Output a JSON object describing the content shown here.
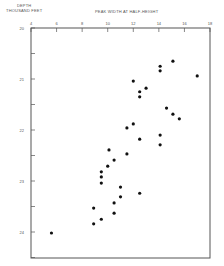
{
  "chart_data": {
    "type": "scatter",
    "title": "",
    "xlabel": "PEAK WIDTH AT HALF-HEIGHT",
    "ylabel": "DEPTH THOUSAND FEET",
    "ylabel_lines": [
      "DEPTH",
      "THOUSAND FEET"
    ],
    "xlim": [
      4,
      18
    ],
    "ylim": [
      20,
      24.5
    ],
    "y_inverted": true,
    "x_ticks": [
      4,
      6,
      8,
      10,
      12,
      14,
      16,
      18
    ],
    "y_ticks": [
      20,
      21,
      22,
      23,
      24
    ],
    "grid": false,
    "legend": null,
    "x_axis_position": "top",
    "points": [
      {
        "x": 12.0,
        "y": 21.04
      },
      {
        "x": 12.5,
        "y": 21.25
      },
      {
        "x": 13.0,
        "y": 21.18
      },
      {
        "x": 12.5,
        "y": 21.35
      },
      {
        "x": 14.1,
        "y": 20.75
      },
      {
        "x": 14.1,
        "y": 20.84
      },
      {
        "x": 15.1,
        "y": 20.65
      },
      {
        "x": 17.0,
        "y": 20.94
      },
      {
        "x": 14.6,
        "y": 21.57
      },
      {
        "x": 15.1,
        "y": 21.69
      },
      {
        "x": 15.6,
        "y": 21.78
      },
      {
        "x": 11.5,
        "y": 21.96
      },
      {
        "x": 12.0,
        "y": 21.88
      },
      {
        "x": 14.1,
        "y": 22.1
      },
      {
        "x": 12.5,
        "y": 22.18
      },
      {
        "x": 14.1,
        "y": 22.29
      },
      {
        "x": 10.1,
        "y": 22.39
      },
      {
        "x": 11.5,
        "y": 22.47
      },
      {
        "x": 10.5,
        "y": 22.59
      },
      {
        "x": 10.0,
        "y": 22.71
      },
      {
        "x": 9.5,
        "y": 22.82
      },
      {
        "x": 9.5,
        "y": 22.92
      },
      {
        "x": 9.5,
        "y": 23.04
      },
      {
        "x": 11.0,
        "y": 23.12
      },
      {
        "x": 11.0,
        "y": 23.31
      },
      {
        "x": 12.5,
        "y": 23.24
      },
      {
        "x": 10.5,
        "y": 23.43
      },
      {
        "x": 8.9,
        "y": 23.53
      },
      {
        "x": 10.5,
        "y": 23.63
      },
      {
        "x": 9.5,
        "y": 23.75
      },
      {
        "x": 8.9,
        "y": 23.84
      },
      {
        "x": 5.6,
        "y": 24.02
      }
    ]
  },
  "colors": {
    "axis": "#555555",
    "point": "#111111",
    "background": "#ffffff"
  }
}
